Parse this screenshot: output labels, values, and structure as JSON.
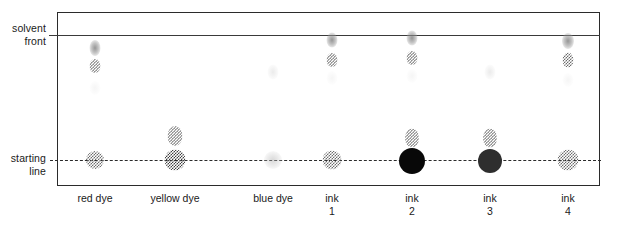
{
  "diagram": {
    "type": "chromatogram"
  },
  "labels": {
    "solvent_front": "solvent\nfront",
    "starting_line": "starting\nline"
  },
  "colors": {
    "paper_border": "#2b2b2b",
    "solvent_front_line": "#3a3a3a",
    "starting_line": "#2b2b2b",
    "black_spot": "#080808",
    "dark_grey_spot": "#2e2e2e",
    "checker_spot": "#6d6d6d",
    "text": "#1a1a1a",
    "background": "#ffffff"
  },
  "chart_data": {
    "type": "chromatogram",
    "xlabel": "",
    "ylabel": "",
    "grid": false,
    "legend": "none",
    "reference_lines": [
      {
        "name": "solvent front",
        "y_px": 35,
        "rf": 1.0,
        "style": "solid"
      },
      {
        "name": "starting line",
        "y_px": 160,
        "rf": 0.0,
        "style": "dashed"
      }
    ],
    "plate": {
      "left_px": 57,
      "top_px": 12,
      "right_px": 600,
      "bottom_px": 186
    },
    "categories": [
      "red dye",
      "yellow dye",
      "blue dye",
      "ink 1",
      "ink 2",
      "ink 3",
      "ink 4"
    ],
    "lanes": [
      {
        "label": "red dye",
        "label_line1": "red dye",
        "label_line2": "",
        "x_px": 95,
        "spots": [
          {
            "y_px": 48,
            "rf": 0.9,
            "w": 11,
            "h": 16,
            "style": "soft",
            "intensity": "medium"
          },
          {
            "y_px": 66,
            "rf": 0.75,
            "w": 11,
            "h": 14,
            "style": "checker",
            "intensity": "medium"
          },
          {
            "y_px": 88,
            "rf": 0.58,
            "w": 11,
            "h": 14,
            "style": "soft-ghost",
            "intensity": "very faint"
          },
          {
            "y_px": 160,
            "rf": 0.0,
            "w": 18,
            "h": 18,
            "style": "checker",
            "intensity": "medium"
          }
        ]
      },
      {
        "label": "yellow dye",
        "label_line1": "yellow dye",
        "label_line2": "",
        "x_px": 175,
        "spots": [
          {
            "y_px": 136,
            "rf": 0.19,
            "w": 15,
            "h": 20,
            "style": "checker",
            "intensity": "medium"
          },
          {
            "y_px": 160,
            "rf": 0.0,
            "w": 21,
            "h": 21,
            "style": "checker-dark",
            "intensity": "strong"
          }
        ]
      },
      {
        "label": "blue dye",
        "label_line1": "blue dye",
        "label_line2": "",
        "x_px": 273,
        "spots": [
          {
            "y_px": 72,
            "rf": 0.7,
            "w": 11,
            "h": 15,
            "style": "soft-vfaint",
            "intensity": "very faint"
          },
          {
            "y_px": 160,
            "rf": 0.0,
            "w": 18,
            "h": 18,
            "style": "soft-faint",
            "intensity": "faint"
          }
        ]
      },
      {
        "label": "ink 1",
        "label_line1": "ink",
        "label_line2": "1",
        "x_px": 332,
        "spots": [
          {
            "y_px": 40,
            "rf": 0.96,
            "w": 11,
            "h": 15,
            "style": "soft",
            "intensity": "medium"
          },
          {
            "y_px": 60,
            "rf": 0.8,
            "w": 11,
            "h": 14,
            "style": "checker",
            "intensity": "medium"
          },
          {
            "y_px": 78,
            "rf": 0.66,
            "w": 11,
            "h": 14,
            "style": "soft-ghost",
            "intensity": "very faint"
          },
          {
            "y_px": 160,
            "rf": 0.0,
            "w": 19,
            "h": 19,
            "style": "checker",
            "intensity": "medium"
          }
        ]
      },
      {
        "label": "ink 2",
        "label_line1": "ink",
        "label_line2": "2",
        "x_px": 412,
        "spots": [
          {
            "y_px": 38,
            "rf": 0.98,
            "w": 11,
            "h": 15,
            "style": "soft",
            "intensity": "medium"
          },
          {
            "y_px": 58,
            "rf": 0.82,
            "w": 11,
            "h": 14,
            "style": "checker",
            "intensity": "medium"
          },
          {
            "y_px": 76,
            "rf": 0.67,
            "w": 11,
            "h": 14,
            "style": "soft-ghost",
            "intensity": "very faint"
          },
          {
            "y_px": 138,
            "rf": 0.18,
            "w": 14,
            "h": 19,
            "style": "checker",
            "intensity": "medium"
          },
          {
            "y_px": 161,
            "rf": 0.0,
            "w": 26,
            "h": 26,
            "style": "solid",
            "intensity": "black"
          }
        ]
      },
      {
        "label": "ink 3",
        "label_line1": "ink",
        "label_line2": "3",
        "x_px": 490,
        "spots": [
          {
            "y_px": 72,
            "rf": 0.7,
            "w": 11,
            "h": 15,
            "style": "soft-vfaint",
            "intensity": "very faint"
          },
          {
            "y_px": 138,
            "rf": 0.18,
            "w": 14,
            "h": 19,
            "style": "checker",
            "intensity": "medium"
          },
          {
            "y_px": 161,
            "rf": 0.0,
            "w": 24,
            "h": 24,
            "style": "solid-dark",
            "intensity": "dark grey"
          }
        ]
      },
      {
        "label": "ink 4",
        "label_line1": "ink",
        "label_line2": "4",
        "x_px": 568,
        "spots": [
          {
            "y_px": 41,
            "rf": 0.95,
            "w": 12,
            "h": 16,
            "style": "soft",
            "intensity": "medium"
          },
          {
            "y_px": 60,
            "rf": 0.8,
            "w": 11,
            "h": 15,
            "style": "checker",
            "intensity": "medium"
          },
          {
            "y_px": 80,
            "rf": 0.64,
            "w": 11,
            "h": 14,
            "style": "soft-ghost",
            "intensity": "very faint"
          },
          {
            "y_px": 160,
            "rf": 0.0,
            "w": 21,
            "h": 21,
            "style": "checker",
            "intensity": "medium"
          }
        ]
      }
    ]
  }
}
